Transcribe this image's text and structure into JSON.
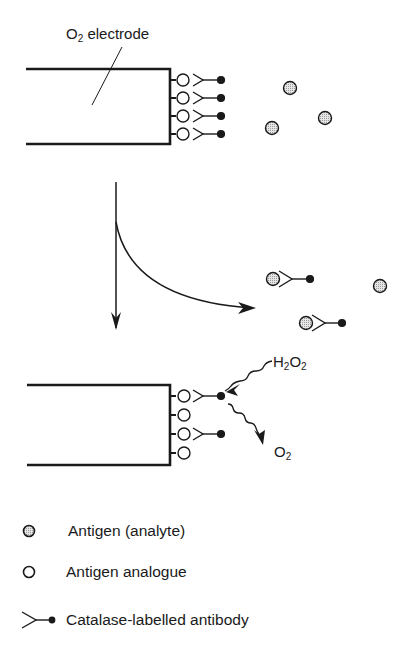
{
  "labels": {
    "electrode": {
      "main": "O",
      "sub": "2",
      "rest": " electrode"
    },
    "h2o2": {
      "a": "H",
      "a_sub": "2",
      "b": "O",
      "b_sub": "2"
    },
    "o2": {
      "main": "O",
      "sub": "2"
    }
  },
  "legend": {
    "items": [
      {
        "symbol": "antigen-analyte",
        "label": "Antigen (analyte)"
      },
      {
        "symbol": "antigen-analogue",
        "label": "Antigen analogue"
      },
      {
        "symbol": "catalase-labelled-antibody",
        "label": "Catalase-labelled antibody"
      }
    ]
  },
  "colors": {
    "ink": "#1a1a1a",
    "analyte_fill": "#c8c8c8",
    "background": "#ffffff"
  }
}
